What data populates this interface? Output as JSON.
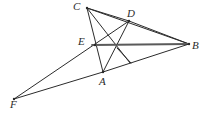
{
  "figure": {
    "width": 204,
    "height": 116,
    "background_color": "#ffffff",
    "line_color": "#2b2b2b",
    "accent_line_color": "#5a5a5a",
    "points": [
      {
        "id": "C",
        "label": "C",
        "x": 87,
        "y": 8,
        "label_x": 73,
        "label_y": 1
      },
      {
        "id": "D",
        "label": "D",
        "x": 129,
        "y": 21,
        "label_x": 127,
        "label_y": 8
      },
      {
        "id": "B",
        "label": "B",
        "x": 189,
        "y": 44,
        "label_x": 192,
        "label_y": 40
      },
      {
        "id": "E",
        "label": "E",
        "x": 95,
        "y": 45,
        "label_x": 78,
        "label_y": 36
      },
      {
        "id": "A",
        "label": "A",
        "x": 103,
        "y": 72,
        "label_x": 99,
        "label_y": 76
      },
      {
        "id": "F",
        "label": "F",
        "x": 14,
        "y": 99,
        "label_x": 10,
        "label_y": 99
      }
    ],
    "segments": [
      {
        "id": "CD",
        "from": "C",
        "to": "D",
        "x1": 87,
        "y1": 8,
        "x2": 129,
        "y2": 21,
        "weight": 1.0
      },
      {
        "id": "CB",
        "from": "C",
        "to": "B",
        "x1": 87,
        "y1": 8,
        "x2": 189,
        "y2": 44,
        "weight": 1.0
      },
      {
        "id": "CA",
        "from": "C",
        "to": "A",
        "x1": 87,
        "y1": 8,
        "x2": 103,
        "y2": 72,
        "weight": 1.0
      },
      {
        "id": "CG",
        "from": "C",
        "to": "G",
        "x1": 87,
        "y1": 8,
        "x2": 130,
        "y2": 63,
        "weight": 1.0
      },
      {
        "id": "DB",
        "from": "D",
        "to": "B",
        "x1": 129,
        "y1": 21,
        "x2": 189,
        "y2": 44,
        "weight": 1.0
      },
      {
        "id": "DA",
        "from": "D",
        "to": "A",
        "x1": 129,
        "y1": 21,
        "x2": 103,
        "y2": 72,
        "weight": 1.0
      },
      {
        "id": "DF",
        "from": "D",
        "to": "F",
        "x1": 129,
        "y1": 21,
        "x2": 14,
        "y2": 99,
        "weight": 1.0
      },
      {
        "id": "EB",
        "from": "E",
        "to": "B",
        "x1": 92,
        "y1": 45,
        "x2": 189,
        "y2": 44,
        "weight": 1.8
      },
      {
        "id": "AB",
        "from": "A",
        "to": "B",
        "x1": 103,
        "y1": 72,
        "x2": 189,
        "y2": 44,
        "weight": 1.0
      },
      {
        "id": "AF",
        "from": "A",
        "to": "F",
        "x1": 103,
        "y1": 72,
        "x2": 14,
        "y2": 99,
        "weight": 1.0
      },
      {
        "id": "HG",
        "from": "H",
        "to": "G",
        "x1": 117,
        "y1": 48,
        "x2": 131,
        "y2": 63,
        "weight": 1.0
      }
    ]
  }
}
